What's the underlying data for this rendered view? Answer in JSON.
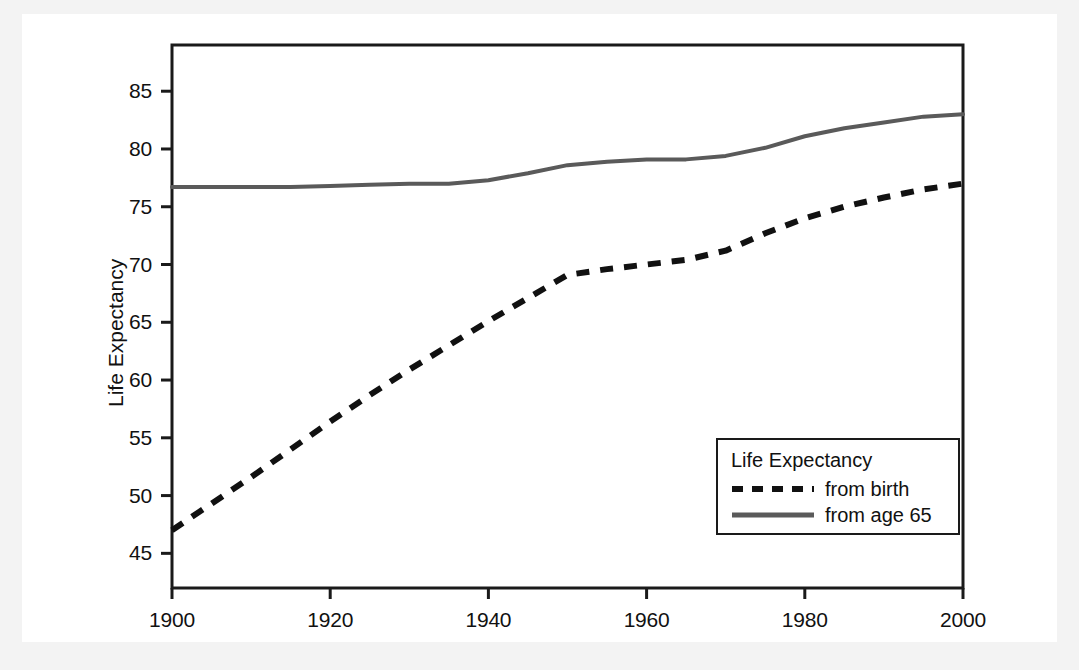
{
  "figure": {
    "background": "#f3f3f3",
    "canvas_background": "#ffffff",
    "frame_color": "#1a1a1a"
  },
  "chart_data": {
    "type": "line",
    "title": "",
    "xlabel": "",
    "ylabel": "Life Expectancy",
    "xlim": [
      1900,
      2000
    ],
    "ylim": [
      42,
      89
    ],
    "xticks": [
      1900,
      1920,
      1940,
      1960,
      1980,
      2000
    ],
    "yticks": [
      45,
      50,
      55,
      60,
      65,
      70,
      75,
      80,
      85
    ],
    "xtick_labels": [
      "1900",
      "1920",
      "1940",
      "1960",
      "1980",
      "2000"
    ],
    "ytick_labels": [
      "45",
      "50",
      "55",
      "60",
      "65",
      "70",
      "75",
      "80",
      "85"
    ],
    "grid": false,
    "legend_position": "lower right",
    "legend_title": "Life Expectancy",
    "x": [
      1900,
      1905,
      1910,
      1915,
      1920,
      1925,
      1930,
      1935,
      1940,
      1945,
      1950,
      1955,
      1960,
      1965,
      1970,
      1975,
      1980,
      1985,
      1990,
      1995,
      2000
    ],
    "series": [
      {
        "name": "from birth",
        "style": "dashed",
        "color": "#111111",
        "values": [
          47.0,
          49.3,
          51.6,
          54.0,
          56.4,
          58.7,
          60.9,
          63.0,
          65.1,
          67.1,
          69.1,
          69.6,
          70.0,
          70.4,
          71.2,
          72.7,
          74.0,
          75.0,
          75.8,
          76.5,
          77.0
        ]
      },
      {
        "name": "from age 65",
        "style": "solid",
        "color": "#5a5a5a",
        "values": [
          76.7,
          76.7,
          76.7,
          76.7,
          76.8,
          76.9,
          77.0,
          77.0,
          77.3,
          77.9,
          78.6,
          78.9,
          79.1,
          79.1,
          79.4,
          80.1,
          81.1,
          81.8,
          82.3,
          82.8,
          83.0
        ]
      }
    ]
  },
  "legend": {
    "title": "Life Expectancy",
    "entries": [
      {
        "label": "from birth",
        "style": "dashed"
      },
      {
        "label": "from age 65",
        "style": "solid"
      }
    ]
  }
}
